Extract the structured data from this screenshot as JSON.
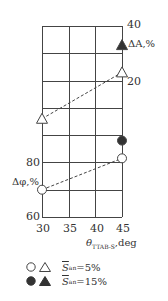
{
  "chart_data": {
    "type": "scatter",
    "title": "",
    "xlabel": "θ_TTAB-S, deg",
    "x_ticks": [
      30,
      35,
      40,
      45
    ],
    "xlim": [
      30,
      45
    ],
    "grid": true,
    "axes": {
      "left": {
        "label": "Δφ,%",
        "ticks": [
          60,
          80
        ],
        "range": [
          60,
          130
        ]
      },
      "right": {
        "label": "ΔA,%",
        "ticks": [
          20,
          40
        ],
        "range": [
          -30,
          40
        ]
      }
    },
    "series": [
      {
        "name": "Δφ, S̄an=5%",
        "axis": "left",
        "marker": "circle-open",
        "line": "dashed",
        "x": [
          30,
          45
        ],
        "y": [
          70,
          81.5
        ]
      },
      {
        "name": "Δφ, S̄an=15%",
        "axis": "left",
        "marker": "circle-filled",
        "line": "none",
        "x": [
          45
        ],
        "y": [
          88
        ]
      },
      {
        "name": "ΔA, S̄an=5%",
        "axis": "right",
        "marker": "triangle-open",
        "line": "dashed",
        "x": [
          30,
          45
        ],
        "y": [
          6,
          23
        ]
      },
      {
        "name": "ΔA, S̄an=15%",
        "axis": "right",
        "marker": "triangle-filled",
        "line": "none",
        "x": [
          45
        ],
        "y": [
          33
        ]
      }
    ],
    "legend": [
      {
        "markers": [
          "circle-open",
          "triangle-open"
        ],
        "label": "S̄an=5%"
      },
      {
        "markers": [
          "circle-filled",
          "triangle-filled"
        ],
        "label": "S̄an=15%"
      }
    ],
    "legend_position": "bottom-left"
  },
  "labels": {
    "right_top": "40",
    "right_mid": "20",
    "right_axis": "ΔA,%",
    "left_80": "80",
    "left_60": "60",
    "left_axis": "Δφ,%",
    "x30": "30",
    "x35": "35",
    "x40": "40",
    "x45": "45",
    "xlabel_theta": "θ",
    "xlabel_sub": "TTAB-S",
    "xlabel_unit": ",deg",
    "legend_s": "S",
    "legend_sub": "an",
    "legend_5": "=5%",
    "legend_15": "=15%"
  }
}
